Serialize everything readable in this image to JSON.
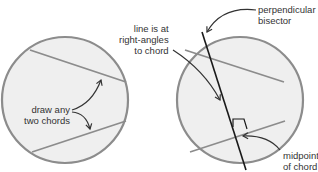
{
  "colors": {
    "circle_fill": "#efefef",
    "circle_stroke": "#8c8c8c",
    "chord_stroke": "#8c8c8c",
    "bisector_stroke": "#1a1a1a",
    "arrow_stroke": "#333333",
    "text": "#333333"
  },
  "left_panel": {
    "label": [
      "draw any",
      "two chords"
    ]
  },
  "right_panel": {
    "label_right_angle": [
      "line is at",
      "right-angles",
      "to chord"
    ],
    "label_bisector": [
      "perpendicular",
      "bisector"
    ],
    "label_midpoint": [
      "midpoint",
      "of chord"
    ]
  }
}
